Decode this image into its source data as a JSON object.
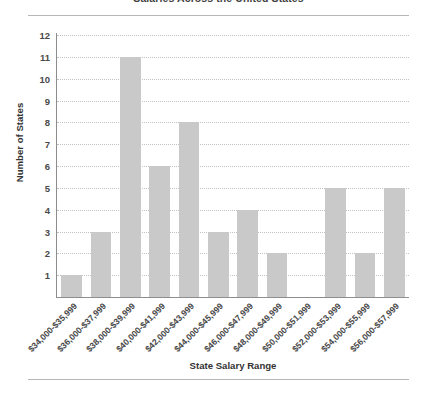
{
  "chart_data": {
    "type": "bar",
    "title": "Salaries Across the United States",
    "xlabel": "State Salary Range",
    "ylabel": "Number of States",
    "categories": [
      "$34,000-$35,999",
      "$36,000-$37,999",
      "$38,000-$39,999",
      "$40,000-$41,999",
      "$42,000-$43,999",
      "$44,000-$45,999",
      "$46,000-$47,999",
      "$48,000-$49,999",
      "$50,000-$51,999",
      "$52,000-$53,999",
      "$54,000-$55,999",
      "$56,000-$57,999"
    ],
    "values": [
      1,
      3,
      11,
      6,
      8,
      3,
      4,
      2,
      0,
      5,
      2,
      5
    ],
    "ylim": [
      0,
      12
    ],
    "ytick_labels": [
      "1",
      "2",
      "3",
      "4",
      "5",
      "6",
      "7",
      "8",
      "9",
      "10",
      "11",
      "12"
    ],
    "grid": "horizontal-dotted",
    "legend": "none",
    "bar_color": "#c9c9c9",
    "axis_color": "#8d8d8d",
    "grid_color": "#c2c2c2",
    "text_color": "#3a3a3a",
    "background": "#ffffff"
  }
}
